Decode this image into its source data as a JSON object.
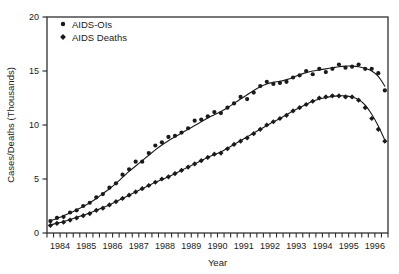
{
  "chart_data": {
    "type": "scatter",
    "title": "",
    "xlabel": "Year",
    "ylabel": "Cases/Deaths (Thousands)",
    "xlim": [
      1984.0,
      1997.0
    ],
    "ylim": [
      0,
      20
    ],
    "yticks": [
      0,
      5,
      10,
      15,
      20
    ],
    "ytick_labels": [
      "0",
      "5",
      "10",
      "15",
      "20"
    ],
    "xtick_labels": [
      "1984",
      "1985",
      "1986",
      "1987",
      "1988",
      "1989",
      "1990",
      "1991",
      "1992",
      "1993",
      "1994",
      "1995",
      "1996"
    ],
    "xtick_minor_per_year": 4,
    "grid": false,
    "legend_position": "top-left",
    "marker_color": "#1a1a1a",
    "line_color": "#1a1a1a",
    "axis_color": "#303030",
    "series": [
      {
        "name": "AIDS-OIs",
        "marker": "circle",
        "x": [
          1984.13,
          1984.38,
          1984.63,
          1984.88,
          1985.13,
          1985.38,
          1985.63,
          1985.88,
          1986.13,
          1986.38,
          1986.63,
          1986.88,
          1987.13,
          1987.38,
          1987.63,
          1987.88,
          1988.13,
          1988.38,
          1988.63,
          1988.88,
          1989.13,
          1989.38,
          1989.63,
          1989.88,
          1990.13,
          1990.38,
          1990.63,
          1990.88,
          1991.13,
          1991.38,
          1991.63,
          1991.88,
          1992.13,
          1992.38,
          1992.63,
          1992.88,
          1993.13,
          1993.38,
          1993.63,
          1993.88,
          1994.13,
          1994.38,
          1994.63,
          1994.88,
          1995.13,
          1995.38,
          1995.63,
          1995.88,
          1996.13,
          1996.38,
          1996.63,
          1996.88
        ],
        "y": [
          1.1,
          1.4,
          1.5,
          1.9,
          2.1,
          2.5,
          2.8,
          3.3,
          3.6,
          4.2,
          4.6,
          5.4,
          5.9,
          6.6,
          6.6,
          7.4,
          8.1,
          8.4,
          8.9,
          9.0,
          9.3,
          9.7,
          10.4,
          10.5,
          10.8,
          11.2,
          11.1,
          11.6,
          12.0,
          12.6,
          12.4,
          13.0,
          13.6,
          14.0,
          13.8,
          13.9,
          14.0,
          14.4,
          14.6,
          15.0,
          14.7,
          15.2,
          14.9,
          15.2,
          15.6,
          15.3,
          15.4,
          15.6,
          15.2,
          15.2,
          14.8,
          13.2
        ],
        "smooth_y": [
          1.15,
          1.35,
          1.6,
          1.85,
          2.15,
          2.45,
          2.8,
          3.2,
          3.65,
          4.1,
          4.6,
          5.15,
          5.7,
          6.2,
          6.7,
          7.2,
          7.7,
          8.15,
          8.55,
          8.9,
          9.25,
          9.6,
          9.95,
          10.3,
          10.65,
          10.95,
          11.25,
          11.6,
          12.0,
          12.4,
          12.8,
          13.2,
          13.55,
          13.8,
          13.95,
          14.05,
          14.2,
          14.4,
          14.65,
          14.85,
          15.0,
          15.1,
          15.2,
          15.3,
          15.4,
          15.45,
          15.45,
          15.4,
          15.25,
          15.0,
          14.5,
          13.6
        ]
      },
      {
        "name": "AIDS Deaths",
        "marker": "diamond",
        "x": [
          1984.13,
          1984.38,
          1984.63,
          1984.88,
          1985.13,
          1985.38,
          1985.63,
          1985.88,
          1986.13,
          1986.38,
          1986.63,
          1986.88,
          1987.13,
          1987.38,
          1987.63,
          1987.88,
          1988.13,
          1988.38,
          1988.63,
          1988.88,
          1989.13,
          1989.38,
          1989.63,
          1989.88,
          1990.13,
          1990.38,
          1990.63,
          1990.88,
          1991.13,
          1991.38,
          1991.63,
          1991.88,
          1992.13,
          1992.38,
          1992.63,
          1992.88,
          1993.13,
          1993.38,
          1993.63,
          1993.88,
          1994.13,
          1994.38,
          1994.63,
          1994.88,
          1995.13,
          1995.38,
          1995.63,
          1995.88,
          1996.13,
          1996.38,
          1996.63,
          1996.88
        ],
        "y": [
          0.7,
          0.9,
          1.0,
          1.2,
          1.4,
          1.6,
          1.8,
          2.1,
          2.3,
          2.6,
          2.9,
          3.2,
          3.5,
          3.8,
          4.1,
          4.4,
          4.7,
          5.0,
          5.2,
          5.5,
          5.8,
          6.1,
          6.4,
          6.7,
          7.0,
          7.3,
          7.4,
          7.8,
          8.2,
          8.5,
          8.8,
          9.2,
          9.6,
          10.0,
          10.3,
          10.6,
          10.9,
          11.3,
          11.6,
          11.9,
          12.2,
          12.5,
          12.6,
          12.7,
          12.7,
          12.6,
          12.6,
          12.3,
          11.6,
          10.6,
          9.6,
          8.5
        ],
        "smooth_y": [
          0.75,
          0.9,
          1.05,
          1.25,
          1.45,
          1.65,
          1.85,
          2.1,
          2.35,
          2.6,
          2.9,
          3.2,
          3.5,
          3.8,
          4.1,
          4.4,
          4.7,
          4.95,
          5.2,
          5.5,
          5.8,
          6.1,
          6.4,
          6.7,
          7.0,
          7.25,
          7.5,
          7.85,
          8.2,
          8.55,
          8.9,
          9.25,
          9.6,
          9.95,
          10.3,
          10.6,
          10.95,
          11.3,
          11.6,
          11.9,
          12.2,
          12.4,
          12.55,
          12.65,
          12.7,
          12.7,
          12.6,
          12.35,
          11.85,
          11.0,
          9.9,
          8.6
        ]
      }
    ],
    "legend": [
      {
        "label": "AIDS-OIs",
        "marker": "circle"
      },
      {
        "label": "AIDS Deaths",
        "marker": "diamond"
      }
    ]
  }
}
